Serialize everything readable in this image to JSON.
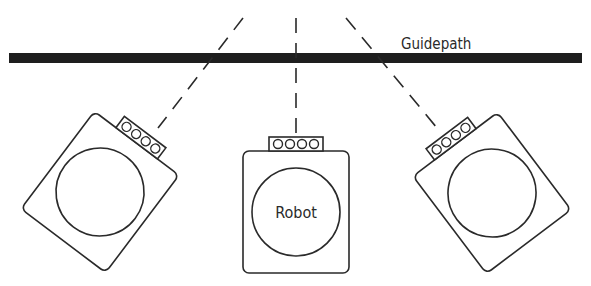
{
  "diagram": {
    "guidepath": {
      "label": "Guidepath",
      "color": "#1e1e1e"
    },
    "robots": [
      {
        "id": "left",
        "label": "",
        "rotation_deg": 37
      },
      {
        "id": "center",
        "label": "Robot",
        "rotation_deg": 0
      },
      {
        "id": "right",
        "label": "",
        "rotation_deg": -37
      }
    ],
    "sensor": {
      "lights": 4
    },
    "colors": {
      "stroke": "#2a2a2a",
      "background": "#ffffff"
    }
  }
}
